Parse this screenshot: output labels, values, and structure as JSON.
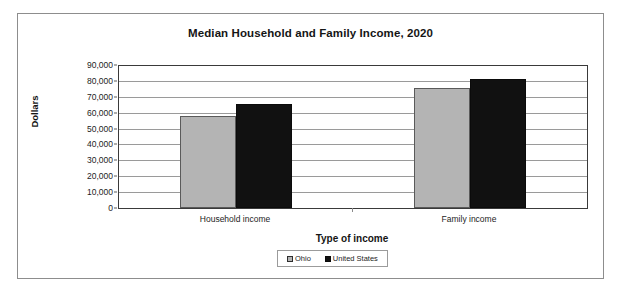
{
  "chart_data": {
    "type": "bar",
    "title": "Median Household and Family Income, 2020",
    "xlabel": "Type of income",
    "ylabel": "Dollars",
    "categories": [
      "Household income",
      "Family income"
    ],
    "series": [
      {
        "name": "Ohio",
        "color": "#b4b4b4",
        "values": [
          58000,
          75500
        ]
      },
      {
        "name": "United States",
        "color": "#111111",
        "values": [
          65500,
          81500
        ]
      }
    ],
    "ylim": [
      0,
      90000
    ],
    "ytick_step": 10000,
    "ytick_labels": [
      "90,000",
      "80,000",
      "70,000",
      "60,000",
      "50,000",
      "40,000",
      "30,000",
      "20,000",
      "10,000",
      "0"
    ],
    "ytick_values": [
      90000,
      80000,
      70000,
      60000,
      50000,
      40000,
      30000,
      20000,
      10000,
      0
    ],
    "grid": true,
    "legend_position": "bottom",
    "legend_entries": [
      "Ohio",
      "United States"
    ]
  }
}
